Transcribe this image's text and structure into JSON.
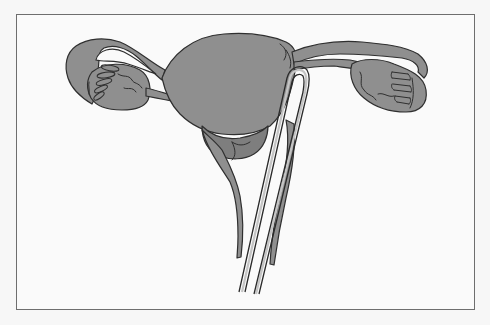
{
  "figure": {
    "type": "anatomical-illustration",
    "labels": [],
    "colors": {
      "background": "#f7f7f7",
      "frame_border": "#6e6e6e",
      "tissue_fill": "#8f8f8f",
      "tissue_shadow": "#7e7e7e",
      "outline": "#2f2f2f",
      "instrument_highlight": "#c4c4c4"
    },
    "parts": [
      "left-fallopian-tube",
      "left-ovary",
      "left-fimbriae",
      "uterus-body",
      "cervix",
      "vaginal-wall",
      "right-fallopian-tube",
      "right-ovary",
      "right-fimbriae",
      "inserted-instrument"
    ]
  }
}
